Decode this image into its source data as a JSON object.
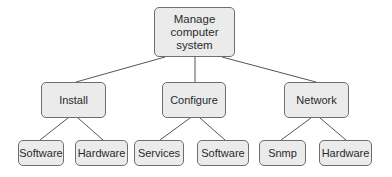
{
  "diagram": {
    "type": "hierarchy-tree",
    "root": {
      "label": "Manage computer system",
      "lines": [
        "Manage",
        "computer",
        "system"
      ]
    },
    "children": [
      {
        "label": "Install",
        "children": [
          {
            "label": "Software"
          },
          {
            "label": "Hardware"
          }
        ]
      },
      {
        "label": "Configure",
        "children": [
          {
            "label": "Services"
          },
          {
            "label": "Software"
          }
        ]
      },
      {
        "label": "Network",
        "children": [
          {
            "label": "Snmp"
          },
          {
            "label": "Hardware"
          }
        ]
      }
    ],
    "colors": {
      "node_fill": "#ebebeb",
      "node_border": "#6e6e6e",
      "edge": "#555555",
      "text": "#2a2a2a"
    }
  }
}
